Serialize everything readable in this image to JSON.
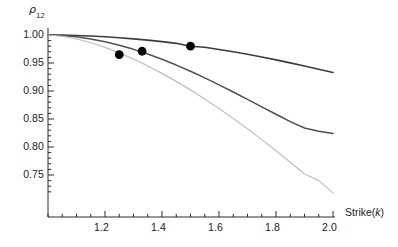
{
  "chart_data": {
    "type": "line",
    "title": "",
    "subtitle": "",
    "xlabel": "Strike(k)",
    "ylabel": "ρ_12",
    "ylabel_base": "ρ",
    "ylabel_sub": "12",
    "xlim": [
      1.0,
      2.05
    ],
    "ylim": [
      0.718,
      1.005
    ],
    "grid": false,
    "legend": "none",
    "xticks": [
      1.2,
      1.4,
      1.6,
      1.8,
      2.0
    ],
    "xtick_labels": [
      "1.2",
      "1.4",
      "1.6",
      "1.8",
      "2.0"
    ],
    "yticks": [
      0.75,
      0.8,
      0.85,
      0.9,
      0.95,
      1.0
    ],
    "ytick_labels": [
      "0.75",
      "0.80",
      "0.85",
      "0.90",
      "0.95",
      "1.00"
    ],
    "x_minor_tick_step": 0.05,
    "y_minor_tick_step": 0.01,
    "series": [
      {
        "name": "curve-upper",
        "color": "#3c3c3c",
        "width": 1.6,
        "x": [
          1.0,
          1.05,
          1.1,
          1.15,
          1.2,
          1.25,
          1.3,
          1.35,
          1.4,
          1.45,
          1.5,
          1.55,
          1.6,
          1.65,
          1.7,
          1.75,
          1.8,
          1.85,
          1.9,
          1.95,
          2.0
        ],
        "values": [
          1.0,
          0.9997,
          0.9991,
          0.9981,
          0.9968,
          0.9951,
          0.9931,
          0.9908,
          0.9881,
          0.9851,
          0.98,
          0.9781,
          0.9742,
          0.97,
          0.9655,
          0.9607,
          0.9556,
          0.9502,
          0.9445,
          0.9388,
          0.933
        ]
      },
      {
        "name": "curve-middle",
        "color": "#505050",
        "width": 1.5,
        "x": [
          1.0,
          1.05,
          1.1,
          1.15,
          1.2,
          1.25,
          1.3,
          1.35,
          1.4,
          1.45,
          1.5,
          1.55,
          1.6,
          1.65,
          1.7,
          1.75,
          1.8,
          1.85,
          1.9,
          1.95,
          2.0
        ],
        "values": [
          1.0,
          0.999,
          0.9967,
          0.993,
          0.988,
          0.9818,
          0.9744,
          0.966,
          0.9566,
          0.9463,
          0.9352,
          0.9234,
          0.911,
          0.8982,
          0.8851,
          0.8718,
          0.8585,
          0.8453,
          0.834,
          0.828,
          0.824
        ]
      },
      {
        "name": "curve-lower",
        "color": "#bfbfbf",
        "width": 1.2,
        "x": [
          1.0,
          1.05,
          1.1,
          1.15,
          1.2,
          1.25,
          1.3,
          1.35,
          1.4,
          1.45,
          1.5,
          1.55,
          1.6,
          1.65,
          1.7,
          1.75,
          1.8,
          1.85,
          1.9,
          1.95,
          2.0
        ],
        "values": [
          1.0,
          0.9978,
          0.993,
          0.9862,
          0.9778,
          0.968,
          0.957,
          0.9448,
          0.9315,
          0.9172,
          0.902,
          0.8858,
          0.8688,
          0.851,
          0.8325,
          0.8132,
          0.7933,
          0.7728,
          0.7517,
          0.74,
          0.718
        ]
      }
    ],
    "points": [
      {
        "name": "data-point-1",
        "x": 1.25,
        "y": 0.965,
        "color": "#000000",
        "radius": 4.4
      },
      {
        "name": "data-point-2",
        "x": 1.33,
        "y": 0.971,
        "color": "#000000",
        "radius": 4.4
      },
      {
        "name": "data-point-3",
        "x": 1.5,
        "y": 0.98,
        "color": "#000000",
        "radius": 4.4
      }
    ],
    "axis_color": "#2a2a2a",
    "background": "#ffffff"
  }
}
